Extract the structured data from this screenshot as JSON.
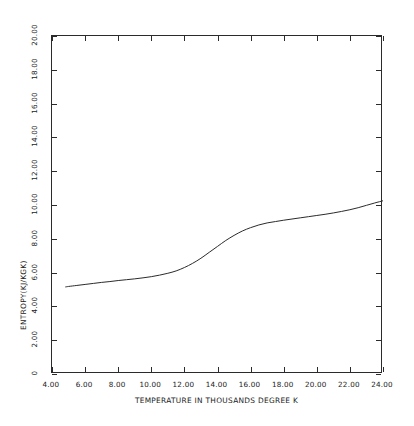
{
  "chart_data": {
    "type": "line",
    "title": "",
    "xlabel": "TEMPERATURE IN THOUSANDS DEGREE K",
    "ylabel": "ENTROPY(KJ/KGK)",
    "xlim": [
      4.0,
      24.0
    ],
    "ylim": [
      0.0,
      20.0
    ],
    "grid": false,
    "legend": "none",
    "xticks": [
      4.0,
      6.0,
      8.0,
      10.0,
      12.0,
      14.0,
      16.0,
      18.0,
      20.0,
      22.0,
      24.0
    ],
    "xtick_labels": [
      "4.00",
      "6.00",
      "8.00",
      "10.00",
      "12.00",
      "14.00",
      "16.00",
      "18.00",
      "20.00",
      "22.00",
      "24.00"
    ],
    "yticks": [
      0.0,
      2.0,
      4.0,
      6.0,
      8.0,
      10.0,
      12.0,
      14.0,
      16.0,
      18.0,
      20.0
    ],
    "ytick_labels": [
      "0",
      "2.00",
      "4.00",
      "6.00",
      "8.00",
      "10.00",
      "12.00",
      "14.00",
      "16.00",
      "18.00",
      "20.00"
    ],
    "series": [
      {
        "name": "entropy",
        "color": "#2b2b2b",
        "x": [
          4.8,
          5.0,
          5.5,
          6.0,
          6.5,
          7.0,
          7.5,
          8.0,
          8.5,
          9.0,
          9.5,
          10.0,
          10.5,
          11.0,
          11.5,
          12.0,
          12.5,
          13.0,
          13.5,
          14.0,
          14.5,
          15.0,
          15.5,
          16.0,
          16.5,
          17.0,
          17.5,
          18.0,
          18.5,
          19.0,
          19.5,
          20.0,
          20.5,
          21.0,
          21.5,
          22.0,
          22.5,
          23.0,
          23.5,
          24.0
        ],
        "y": [
          5.15,
          5.18,
          5.24,
          5.3,
          5.36,
          5.42,
          5.47,
          5.53,
          5.58,
          5.63,
          5.69,
          5.76,
          5.85,
          5.96,
          6.1,
          6.3,
          6.55,
          6.85,
          7.2,
          7.55,
          7.9,
          8.2,
          8.46,
          8.66,
          8.82,
          8.94,
          9.02,
          9.1,
          9.17,
          9.24,
          9.31,
          9.38,
          9.45,
          9.53,
          9.62,
          9.72,
          9.84,
          9.98,
          10.12,
          10.25
        ]
      }
    ]
  },
  "axes": {
    "x_title": "TEMPERATURE IN THOUSANDS DEGREE K",
    "y_title": "ENTROPY(KJ/KGK)"
  }
}
